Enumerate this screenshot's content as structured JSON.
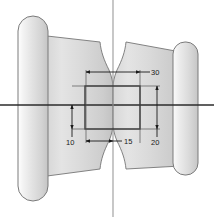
{
  "drawing": {
    "title": "Engineering part section drawing",
    "background_color": "#ffffff",
    "body_fill_light": "#e9e9e9",
    "body_fill_dark": "#c9c9c9",
    "outline_color": "#6e6e6e",
    "centerline_color": "#2b2b2b",
    "dimension_color": "#1a1a1a",
    "view_type": "front-section",
    "shapes": {
      "left_flange": {
        "name": "left-flange-capsule",
        "shape": "rounded-capsule",
        "x": 18,
        "y": 16,
        "width": 30,
        "height": 185,
        "corner_radius": 15
      },
      "right_flange": {
        "name": "right-flange-capsule",
        "shape": "rounded-capsule",
        "x": 173,
        "y": 42,
        "width": 25,
        "height": 133,
        "corner_radius": 12
      },
      "hub_body": {
        "name": "tapered-hub-body",
        "description": "Tapered waisted body with U-shaped notches top and bottom at the vertical centerline"
      },
      "bore_rectangle": {
        "name": "bore-rectangle",
        "x": 85,
        "y": 86,
        "width": 55,
        "height": 43
      }
    },
    "centerlines": {
      "horizontal": {
        "name": "horizontal-centerline",
        "y": 105,
        "x1": 0,
        "x2": 214
      },
      "vertical": {
        "name": "vertical-centerline",
        "x": 113,
        "y1": 0,
        "y2": 217
      }
    },
    "dimensions": [
      {
        "id": "dim-30",
        "label": "30",
        "orientation": "horizontal",
        "position": "top",
        "value": 30,
        "units": "",
        "text_x": 153,
        "text_y": 75,
        "line_y": 72,
        "x1": 86,
        "x2": 140
      },
      {
        "id": "dim-15",
        "label": "15",
        "orientation": "horizontal",
        "position": "bottom",
        "value": 15,
        "units": "",
        "text_x": 126,
        "text_y": 145,
        "line_y": 141,
        "x1": 86,
        "x2": 113
      },
      {
        "id": "dim-10",
        "label": "10",
        "orientation": "vertical",
        "position": "left",
        "value": 10,
        "units": "",
        "text_x": 68,
        "text_y": 145,
        "line_x": 72,
        "y1": 105,
        "y2": 129
      },
      {
        "id": "dim-20",
        "label": "20",
        "orientation": "vertical",
        "position": "right",
        "value": 20,
        "units": "",
        "text_x": 156,
        "text_y": 145,
        "line_x": 157,
        "y1": 86,
        "y2": 129
      }
    ]
  }
}
